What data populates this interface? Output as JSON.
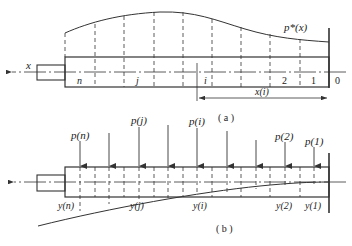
{
  "figure_a": {
    "caption": "( a )",
    "axis_label": "x",
    "curve_label": "p*(x)",
    "segment_labels": [
      "n",
      "j",
      "i",
      "2",
      "1",
      "0"
    ],
    "dimension_label": "x(i)"
  },
  "figure_b": {
    "caption": "( b )",
    "load_labels": [
      "p(n)",
      "p(j)",
      "p(i)",
      "p(2)",
      "p(1)"
    ],
    "deflection_labels": [
      "y(n)",
      "y(j)",
      "y(i)",
      "y(2)",
      "y(1)"
    ]
  },
  "colors": {
    "line": "#333333",
    "background": "#ffffff"
  }
}
